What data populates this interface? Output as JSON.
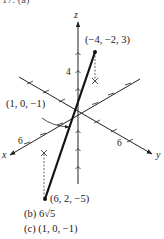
{
  "problem": {
    "label": "17. (a)",
    "answers": [
      {
        "part": "(b)",
        "value": "6√5"
      },
      {
        "part": "(c)",
        "value": "(1, 0, −1)"
      }
    ]
  },
  "figure": {
    "axes": {
      "x_label": "x",
      "y_label": "y",
      "z_label": "z"
    },
    "tick_labels": {
      "z": "4",
      "x": "6",
      "y": "6"
    },
    "points": [
      {
        "label": "(−4, −2, 3)",
        "coords": [
          -4,
          -2,
          3
        ]
      },
      {
        "label": "(6, 2, −5)",
        "coords": [
          6,
          2,
          -5
        ]
      },
      {
        "label": "(1, 0, −1)",
        "coords": [
          1,
          0,
          -1
        ],
        "note": "midpoint"
      }
    ],
    "colors": {
      "ink": "#222222",
      "background": "#ffffff"
    }
  }
}
